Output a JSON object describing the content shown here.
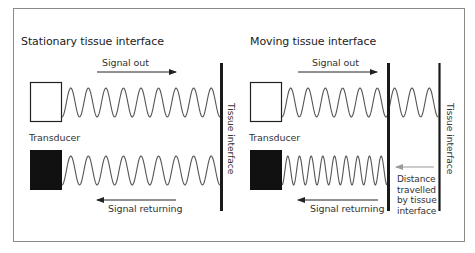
{
  "figure": {
    "colors": {
      "frame": "#8a8a8a",
      "ink": "#222222",
      "wave": "#555555",
      "wall": "#1a1a1a",
      "grey_arrow": "#9a9a9a",
      "transducer_fill_receiving": "#111111"
    },
    "panels": [
      {
        "id": "stationary",
        "title": "Stationary tissue interface",
        "transducer_label": "Transducer",
        "signal_out_label": "Signal out",
        "signal_returning_label": "Signal returning",
        "tissue_interface_label": "Tissue interface",
        "outgoing_wave_cycles": 9,
        "returning_wave_cycles": 9
      },
      {
        "id": "moving",
        "title": "Moving tissue interface",
        "transducer_label": "Transducer",
        "signal_out_label": "Signal out",
        "signal_returning_label": "Signal returning",
        "tissue_interface_label": "Tissue interface",
        "distance_label_lines": [
          "Distance",
          "travelled",
          "by tissue",
          "interface"
        ],
        "outgoing_wave_cycles": 9,
        "returning_wave_cycles": 9
      }
    ]
  }
}
